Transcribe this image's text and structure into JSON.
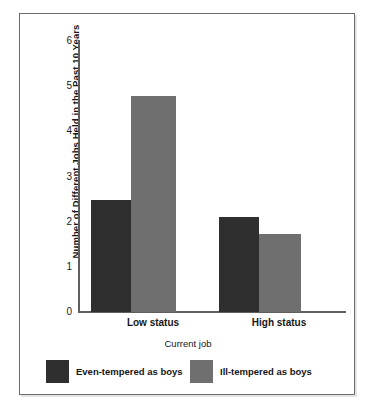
{
  "chart_data": {
    "type": "bar",
    "title": "",
    "xlabel": "Current job",
    "ylabel": "Number of Different Jobs Held in the Past 10 Years",
    "categories": [
      "Low status",
      "High status"
    ],
    "series": [
      {
        "name": "Even-tempered as boys",
        "color": "#2f2f2f",
        "values": [
          2.6,
          2.2
        ]
      },
      {
        "name": "Ill-tempered as boys",
        "color": "#6f6f6f",
        "values": [
          5.0,
          1.8
        ]
      }
    ],
    "ylim": [
      0,
      6.3
    ],
    "yticks": [
      0,
      1,
      2,
      3,
      4,
      5,
      6
    ],
    "ytick_labels": [
      "0",
      "1",
      "2",
      "3",
      "4",
      "5",
      "6"
    ],
    "grid": false,
    "legend_position": "bottom"
  },
  "axis": {
    "y_title": "Number of Different Jobs Held in the Past 10 Years",
    "x_title": "Current job",
    "y_tick_labels": [
      "6",
      "5",
      "4",
      "3",
      "2",
      "1",
      "0"
    ],
    "x_tick_labels": [
      "Low status",
      "High status"
    ]
  },
  "legend": {
    "items": [
      {
        "label": "Even-tempered as boys",
        "swatch": "dark"
      },
      {
        "label": "Ill-tempered as boys",
        "swatch": "light"
      }
    ]
  },
  "colors": {
    "dark_bar": "#2f2f2f",
    "light_bar": "#6f6f6f",
    "axis": "#5f5f5f",
    "frame": "#6b6b6b",
    "background": "#ffffff"
  }
}
